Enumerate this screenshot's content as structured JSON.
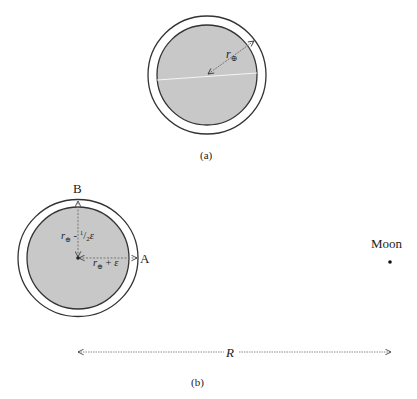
{
  "figure": {
    "panels": [
      {
        "id": "a",
        "caption": "(a)",
        "earth": {
          "center": [
            207,
            75
          ],
          "inner_radius": 50,
          "outer_radius": 59
        },
        "radius_label": "r",
        "radius_subscript": "⊕"
      },
      {
        "id": "b",
        "caption": "(b)",
        "earth": {
          "center": [
            78,
            258
          ],
          "inner_radius": 51,
          "outer_rx": 60,
          "outer_ry": 58.5
        },
        "point_B": "B",
        "point_A": "A",
        "label_B_radius": {
          "r": "r",
          "sub": "⊕",
          "op": " - ",
          "frac_num": "1",
          "frac_den": "2",
          "eps": "ε"
        },
        "label_A_radius": {
          "r": "r",
          "sub": "⊕",
          "op": " + ",
          "eps": "ε"
        },
        "moon_label": "Moon",
        "distance_label": "R"
      }
    ],
    "colors": {
      "earth_fill": "#c8c8c8",
      "stroke": "#333333",
      "dotted": "#8a8a8a"
    }
  }
}
